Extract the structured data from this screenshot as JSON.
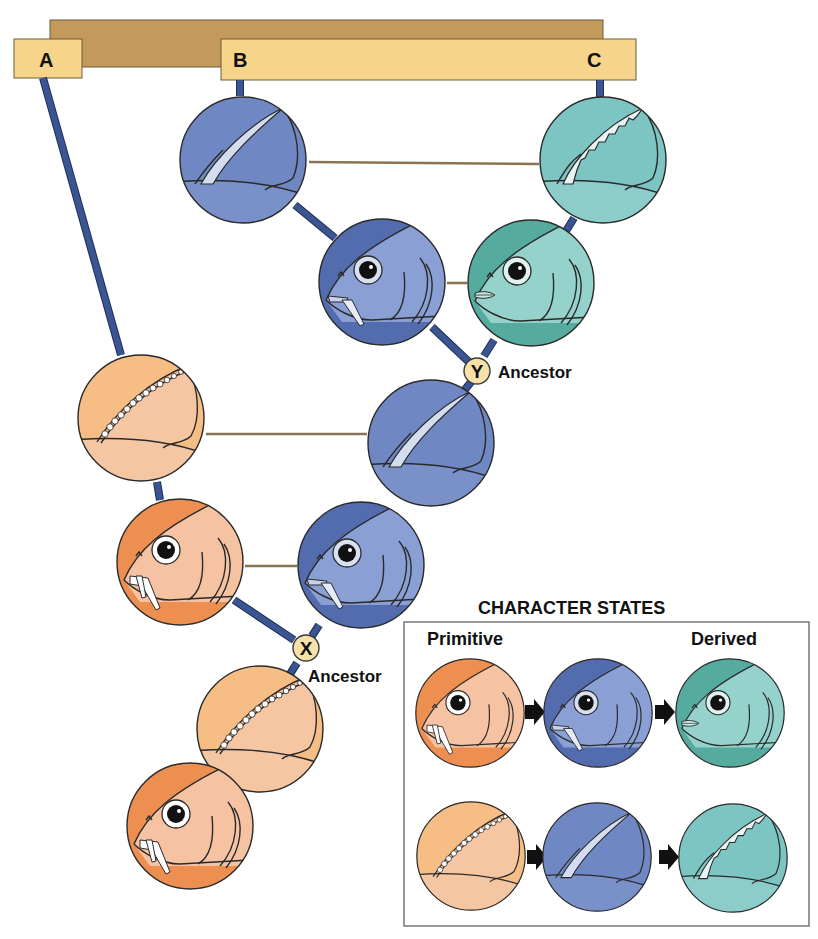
{
  "taxa": {
    "A": "A",
    "B": "B",
    "C": "C"
  },
  "ancestors": {
    "X": {
      "letter": "X",
      "label": "Ancestor"
    },
    "Y": {
      "letter": "Y",
      "label": "Ancestor"
    }
  },
  "character_states": {
    "title": "CHARACTER STATES",
    "primitive_label": "Primitive",
    "derived_label": "Derived",
    "rows": [
      {
        "trait": "head-jaw",
        "states": [
          "orange-primitive",
          "blue-intermediate",
          "teal-derived"
        ]
      },
      {
        "trait": "fin-spine",
        "states": [
          "orange-primitive",
          "blue-intermediate",
          "teal-derived"
        ]
      }
    ]
  },
  "colors": {
    "orange_head": "#f0955a",
    "orange_light": "#f7c597",
    "peach_face": "#f6c3a3",
    "blue": "#6b84bf",
    "blue_dark": "#4e66a8",
    "blue_light": "#8fa2d2",
    "teal": "#6cbdb5",
    "teal_dark": "#4fa99e",
    "teal_light": "#94d0c9",
    "bar_brown": "#c49a5c",
    "bar_yellow": "#f6d48a",
    "branch_blue": "#3a5592",
    "ancestor_node": "#f6e2a8"
  },
  "nodes": [
    {
      "id": "B-fin",
      "type": "fin",
      "color": "blue",
      "cx": 243,
      "cy": 160
    },
    {
      "id": "C-fin",
      "type": "fin",
      "color": "teal",
      "cx": 603,
      "cy": 160
    },
    {
      "id": "B-head",
      "type": "head",
      "color": "blue",
      "cx": 382,
      "cy": 282
    },
    {
      "id": "C-head",
      "type": "head",
      "color": "teal",
      "cx": 531,
      "cy": 283
    },
    {
      "id": "A-fin",
      "type": "fin",
      "color": "orange",
      "cx": 141,
      "cy": 418
    },
    {
      "id": "Y-fin",
      "type": "fin",
      "color": "blue",
      "cx": 431,
      "cy": 443
    },
    {
      "id": "A-head",
      "type": "head",
      "color": "orange",
      "cx": 180,
      "cy": 562
    },
    {
      "id": "Y-head",
      "type": "head",
      "color": "blue",
      "cx": 361,
      "cy": 565
    },
    {
      "id": "X-fin",
      "type": "fin",
      "color": "orange",
      "cx": 260,
      "cy": 729
    },
    {
      "id": "X-head",
      "type": "head",
      "color": "orange",
      "cx": 190,
      "cy": 826
    }
  ]
}
